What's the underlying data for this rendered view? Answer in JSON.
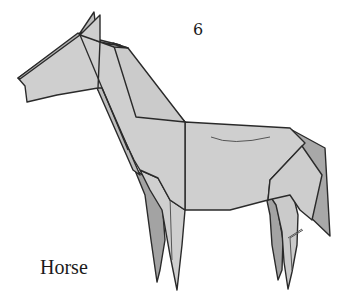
{
  "figure": {
    "step_number": "6",
    "caption": "Horse",
    "colors": {
      "paper_light": "#cfcfcf",
      "paper_mid": "#bdbdbd",
      "paper_dark": "#a3a3a3",
      "outline": "#2a2a2a",
      "background": "#ffffff"
    }
  }
}
